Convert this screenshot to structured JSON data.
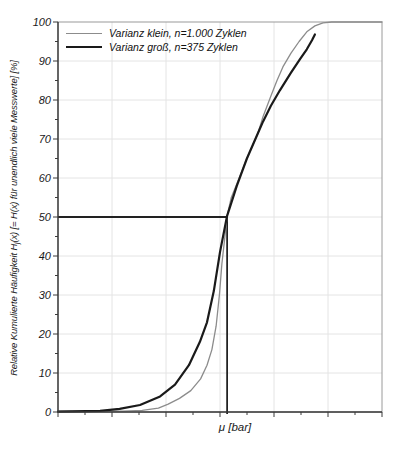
{
  "figure": {
    "x_axis_label": "μ [bar]",
    "y_axis_label_pre": "Relative Kumulierte Häufigkeit H",
    "y_axis_label_sub": "j",
    "y_axis_label_post": "(x) [= H(x) für unendlich viele Messwerte] [%]"
  },
  "colors": {
    "background": "#ffffff",
    "frame": "#9a9a9a",
    "axis": "#3a3a3a",
    "grid": "#e4e4e4",
    "crosshair": "#222222",
    "text": "#1a1a1a",
    "series_klein": "#8c8c8c",
    "series_gross": "#1a1a1a"
  },
  "chart_data": {
    "type": "line",
    "title": "",
    "xlabel": "μ [bar]",
    "ylabel": "Relative Kumulierte Häufigkeit Hj(x) [= H(x) für unendlich viele Messwerte] [%]",
    "x_unit": "normalized 0-1 across plot width (no numeric x tick labels shown)",
    "ylim": [
      0,
      100
    ],
    "y_tick_labels": [
      "0",
      "10",
      "20",
      "30",
      "40",
      "50",
      "60",
      "70",
      "80",
      "90",
      "100"
    ],
    "y_major_step": 10,
    "y_minor_step": 5,
    "x_major_divisions": 6,
    "x_minor_per_major": 2,
    "grid": true,
    "legend_position": "top-left-inside",
    "annotations": {
      "median_crosshair": {
        "x": 0.522,
        "y": 50,
        "note": "horizontal line at H(x)=50% from y-axis to curves, vertical line down to x-axis at μ"
      }
    },
    "series": [
      {
        "name": "Varianz klein, n=1.000 Zyklen",
        "color": "#8c8c8c",
        "width": 1.3,
        "points": [
          [
            0.0,
            0.2
          ],
          [
            0.2,
            0.2
          ],
          [
            0.26,
            0.4
          ],
          [
            0.31,
            1
          ],
          [
            0.34,
            2
          ],
          [
            0.375,
            3.5
          ],
          [
            0.41,
            5.5
          ],
          [
            0.44,
            8.5
          ],
          [
            0.46,
            12
          ],
          [
            0.475,
            16
          ],
          [
            0.488,
            22
          ],
          [
            0.498,
            30
          ],
          [
            0.506,
            38
          ],
          [
            0.514,
            44
          ],
          [
            0.522,
            50.3
          ],
          [
            0.535,
            55
          ],
          [
            0.552,
            58.5
          ],
          [
            0.583,
            65
          ],
          [
            0.617,
            71.5
          ],
          [
            0.633,
            75.8
          ],
          [
            0.657,
            81
          ],
          [
            0.676,
            85
          ],
          [
            0.694,
            88.5
          ],
          [
            0.719,
            92
          ],
          [
            0.744,
            95
          ],
          [
            0.768,
            97.5
          ],
          [
            0.793,
            99
          ],
          [
            0.818,
            99.8
          ],
          [
            0.845,
            100
          ],
          [
            1.0,
            100
          ]
        ]
      },
      {
        "name": "Varianz groß, n=375 Zyklen",
        "color": "#1a1a1a",
        "width": 2.2,
        "points": [
          [
            0.0,
            0.1
          ],
          [
            0.13,
            0.3
          ],
          [
            0.19,
            0.8
          ],
          [
            0.253,
            1.8
          ],
          [
            0.315,
            4
          ],
          [
            0.361,
            7
          ],
          [
            0.404,
            12
          ],
          [
            0.438,
            18
          ],
          [
            0.46,
            23
          ],
          [
            0.481,
            31
          ],
          [
            0.5,
            41
          ],
          [
            0.522,
            50.3
          ],
          [
            0.552,
            58
          ],
          [
            0.583,
            65
          ],
          [
            0.617,
            71.5
          ],
          [
            0.633,
            74.5
          ],
          [
            0.657,
            78.5
          ],
          [
            0.685,
            82.5
          ],
          [
            0.719,
            87
          ],
          [
            0.747,
            90.5
          ],
          [
            0.768,
            93
          ],
          [
            0.784,
            95.3
          ],
          [
            0.793,
            96.8
          ]
        ]
      }
    ]
  }
}
